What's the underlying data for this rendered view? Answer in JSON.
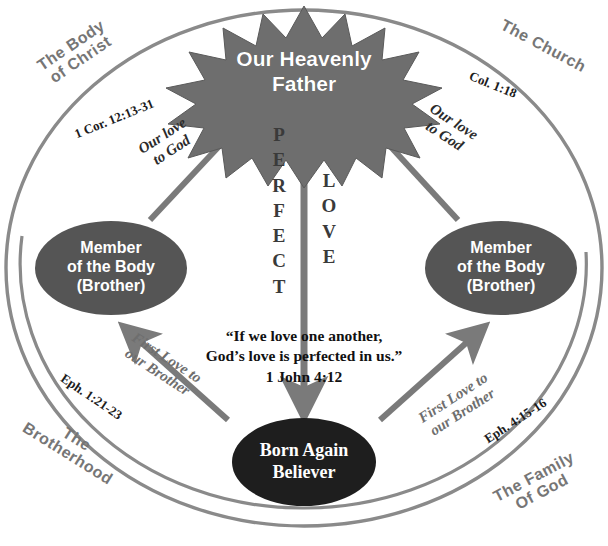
{
  "diagram": {
    "title_center_star": "Our Heavenly\nFather",
    "quote": {
      "line1": "“If we love  one another,",
      "line2": "God’s love is  perfected in us.”",
      "line3": "1 John  4:12"
    },
    "vertical_left": "P\nE\nR\nF\nE\nC\nT",
    "vertical_right": "L\nO\nV\nE",
    "quadrant_labels": [
      {
        "id": "top-left",
        "text": "The Body\nof Christ",
        "rotation": -34
      },
      {
        "id": "top-right",
        "text": "The Church",
        "rotation": 28
      },
      {
        "id": "bottom-left",
        "text": "The\nBrotherhood",
        "rotation": 32
      },
      {
        "id": "bottom-right",
        "text": "The Family\nOf God",
        "rotation": -28
      }
    ],
    "scripture_refs": [
      {
        "id": "ref-top-left",
        "text": "1 Cor. 12:13-31",
        "rotation": -22
      },
      {
        "id": "ref-top-right",
        "text": "Col. 1:18",
        "rotation": 22
      },
      {
        "id": "ref-bottom-left",
        "text": "Eph. 1:21-23",
        "rotation": 34
      },
      {
        "id": "ref-bottom-right",
        "text": "Eph. 4:15-16",
        "rotation": -33
      }
    ],
    "nodes": [
      {
        "id": "heavenly-father",
        "label": "Our Heavenly\nFather",
        "shape": "starburst",
        "fill": "#6e6e6e"
      },
      {
        "id": "member-left",
        "label": "Member\nof  the Body\n(Brother)",
        "shape": "ellipse",
        "fill": "#555555"
      },
      {
        "id": "member-right",
        "label": "Member\nof the Body\n(Brother)",
        "shape": "ellipse",
        "fill": "#555555"
      },
      {
        "id": "born-again",
        "label": "Born Again\nBeliever",
        "shape": "ellipse",
        "fill": "#1e1e1e"
      }
    ],
    "arrow_labels": [
      {
        "id": "arrow-left-up",
        "text": "Our love\nto God",
        "rotation": -33
      },
      {
        "id": "arrow-right-up",
        "text": "Our love\nto God",
        "rotation": 33
      },
      {
        "id": "arrow-bottom-left",
        "text": "First Love to\nour Brother",
        "rotation": 33
      },
      {
        "id": "arrow-bottom-right",
        "text": "First Love to\nour Brother",
        "rotation": -33
      }
    ],
    "colors": {
      "circle_stroke": "#8a8a8a",
      "arrow": "#7a7a7a",
      "star_fill": "#6e6e6e",
      "oval_fill": "#555555",
      "born_fill": "#1e1e1e",
      "corner_text": "#767676"
    }
  }
}
